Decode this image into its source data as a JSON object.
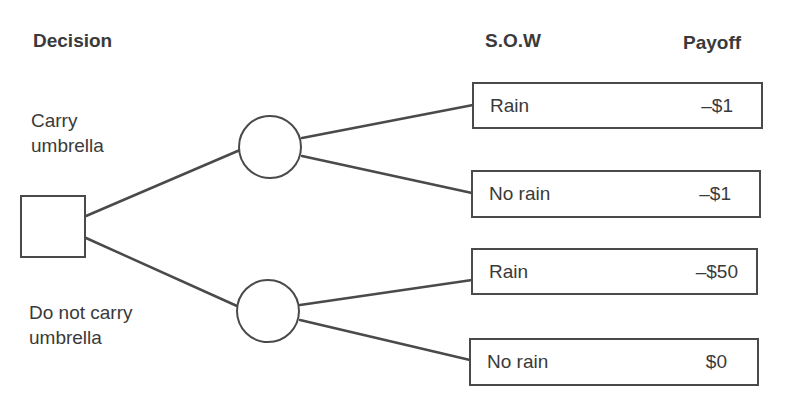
{
  "headers": {
    "decision": "Decision",
    "sow": "S.O.W",
    "payoff": "Payoff"
  },
  "decision_node": {
    "shape": "square"
  },
  "branches": [
    {
      "label_line1": "Carry",
      "label_line2": "umbrella",
      "chance_node": "circle",
      "outcomes": [
        {
          "sow": "Rain",
          "payoff": "–$1"
        },
        {
          "sow": "No rain",
          "payoff": "–$1"
        }
      ]
    },
    {
      "label_line1": "Do not carry",
      "label_line2": "umbrella",
      "chance_node": "circle",
      "outcomes": [
        {
          "sow": "Rain",
          "payoff": "–$50"
        },
        {
          "sow": "No rain",
          "payoff": "$0"
        }
      ]
    }
  ],
  "colors": {
    "line": "#4a4a4a",
    "text": "#3a3a3a",
    "background": "#ffffff"
  }
}
